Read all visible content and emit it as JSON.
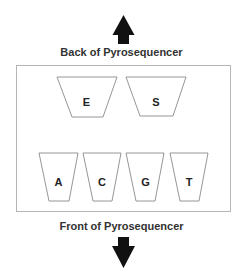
{
  "labels": {
    "back": "Back of Pyrosequencer",
    "front": "Front of Pyrosequencer"
  },
  "arrows": {
    "up": "arrow-up-icon",
    "down": "arrow-down-icon"
  },
  "cartridge": {
    "top_row": [
      {
        "letter": "E",
        "meaning": "Enzyme"
      },
      {
        "letter": "S",
        "meaning": "Substrate"
      }
    ],
    "bottom_row": [
      {
        "letter": "A"
      },
      {
        "letter": "C"
      },
      {
        "letter": "G"
      },
      {
        "letter": "T"
      }
    ]
  },
  "colors": {
    "arrow": "#111111",
    "outline": "#9a9a9a",
    "text": "#333333"
  }
}
